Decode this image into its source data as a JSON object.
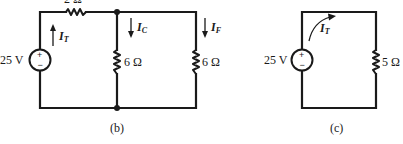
{
  "figure": {
    "circuits": [
      {
        "id": "b",
        "caption": "(b)",
        "source": {
          "label": "25 V",
          "plus": "+",
          "minus": "−"
        },
        "series_resistor": {
          "label": "2 Ω"
        },
        "branches": [
          {
            "resistor_label": "6 Ω",
            "current": {
              "symbol": "I",
              "subscript": "C",
              "direction": "down"
            }
          },
          {
            "resistor_label": "6 Ω",
            "current": {
              "symbol": "I",
              "subscript": "F",
              "direction": "down"
            }
          }
        ],
        "total_current": {
          "symbol": "I",
          "subscript": "T",
          "direction": "up"
        }
      },
      {
        "id": "c",
        "caption": "(c)",
        "source": {
          "label": "25 V",
          "plus": "+",
          "minus": "−"
        },
        "load_resistor": {
          "label": "5 Ω"
        },
        "total_current": {
          "symbol": "I",
          "subscript": "T",
          "direction": "clockwise"
        }
      }
    ],
    "colors": {
      "ink": "#1a1a1a",
      "background": "#ffffff"
    }
  }
}
